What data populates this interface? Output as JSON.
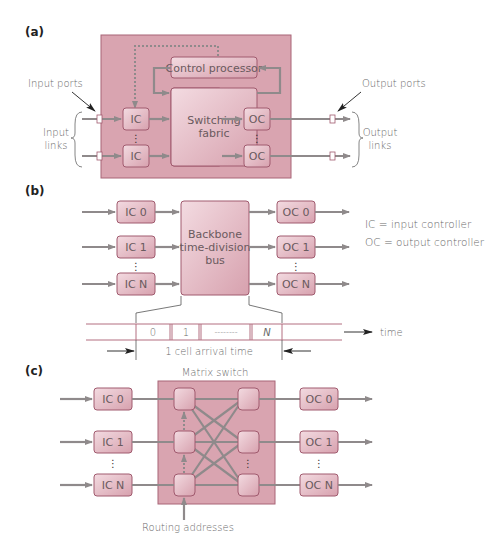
{
  "colors": {
    "panel_fill": "#d9a4b0",
    "panel_stroke": "#a86477",
    "box_fill_light": "#f3dbe1",
    "box_fill_dark": "#d7a1ae",
    "wire": "#8f8a8b",
    "timeline_line": "#b36f80",
    "text": "#6a6a6a"
  },
  "panel_a": {
    "label": "(a)",
    "input_ports": "Input ports",
    "output_ports": "Output ports",
    "input_links_1": "Input",
    "input_links_2": "links",
    "output_links_1": "Output",
    "output_links_2": "links",
    "control_processor": "Control processor",
    "switching_fabric_1": "Switching",
    "switching_fabric_2": "fabric",
    "ic": "IC",
    "oc": "OC"
  },
  "panel_b": {
    "label": "(b)",
    "inputs": [
      "IC 0",
      "IC 1",
      "IC N"
    ],
    "outputs": [
      "OC 0",
      "OC 1",
      "OC N"
    ],
    "bus_1": "Backbone",
    "bus_2": "time-division",
    "bus_3": "bus",
    "legend_ic": "IC = input controller",
    "legend_oc": "OC = output controller",
    "slots": [
      "0",
      "1",
      "--------",
      "N"
    ],
    "time_label": "time",
    "arrival_label": "1 cell arrival time"
  },
  "panel_c": {
    "label": "(c)",
    "title": "Matrix switch",
    "inputs": [
      "IC 0",
      "IC 1",
      "IC N"
    ],
    "outputs": [
      "OC 0",
      "OC 1",
      "OC N"
    ],
    "routing_label": "Routing addresses"
  }
}
